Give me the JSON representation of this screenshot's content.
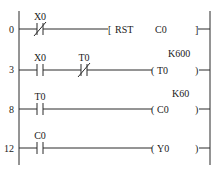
{
  "diagram": {
    "type": "ladder-logic",
    "rungs": [
      {
        "step": "0",
        "contacts": [
          {
            "name": "X0",
            "type": "normally-closed"
          }
        ],
        "output": {
          "kind": "instruction",
          "op": "RST",
          "operand": "C0"
        }
      },
      {
        "step": "3",
        "contacts": [
          {
            "name": "X0",
            "type": "normally-open"
          },
          {
            "name": "T0",
            "type": "normally-closed"
          }
        ],
        "output": {
          "kind": "coil",
          "operand": "T0",
          "constant": "K600"
        }
      },
      {
        "step": "8",
        "contacts": [
          {
            "name": "T0",
            "type": "normally-open"
          }
        ],
        "output": {
          "kind": "coil",
          "operand": "C0",
          "constant": "K60"
        }
      },
      {
        "step": "12",
        "contacts": [
          {
            "name": "C0",
            "type": "normally-open"
          }
        ],
        "output": {
          "kind": "coil",
          "operand": "Y0"
        }
      }
    ]
  }
}
